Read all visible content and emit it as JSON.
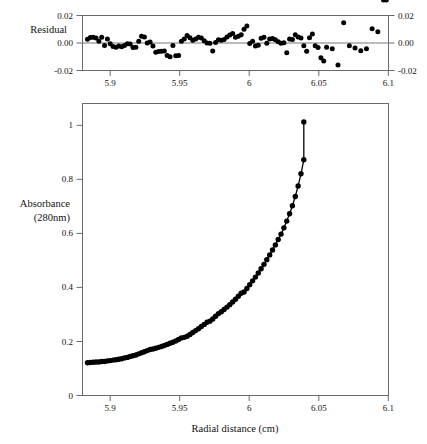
{
  "figure": {
    "background_color": "#ffffff",
    "point_color": "#000000",
    "axis_color": "#6a6a6a",
    "xaxis_title": "Radial distance (cm)",
    "residual_label": "Residual",
    "absorbance_label_line1": "Absorbance",
    "absorbance_label_line2": "(280nm)"
  },
  "chart_data": [
    {
      "type": "scatter",
      "title": "",
      "panel": "residual",
      "xlabel": "",
      "ylabel": "Residual",
      "xlim": [
        5.885,
        6.1
      ],
      "ylim": [
        -0.02,
        0.02
      ],
      "grid": false,
      "legend": "none",
      "xticks": [
        5.9,
        5.95,
        6,
        6.05,
        6.1
      ],
      "xtick_labels": [
        "5.9",
        "5.95",
        "6",
        "6.05",
        "6.1"
      ],
      "yticks": [
        -0.02,
        0.0,
        0.02
      ],
      "ytick_labels": [
        "-0.02",
        "0.00",
        "0.02"
      ],
      "right_axis_yticks": [
        -0.02,
        0.0,
        0.02
      ],
      "right_axis_ytick_labels": [
        "-0.02",
        "0.00",
        "0.02"
      ],
      "zero_reference_line": 0.0,
      "x": [
        5.8885,
        5.8905,
        5.8925,
        5.8945,
        5.8965,
        5.8985,
        5.9005,
        5.9025,
        5.9045,
        5.9065,
        5.9085,
        5.9105,
        5.9125,
        5.9145,
        5.9165,
        5.9185,
        5.9205,
        5.9225,
        5.9245,
        5.9265,
        5.9285,
        5.9305,
        5.9325,
        5.9345,
        5.9365,
        5.9385,
        5.9405,
        5.9425,
        5.9445,
        5.9465,
        5.9485,
        5.9505,
        5.9525,
        5.9545,
        5.9565,
        5.9585,
        5.9605,
        5.9625,
        5.9645,
        5.9665,
        5.9685,
        5.9705,
        5.9725,
        5.9745,
        5.9765,
        5.9785,
        5.9805,
        5.9825,
        5.9845,
        5.9865,
        5.9885,
        5.9905,
        5.9925,
        5.9945,
        5.9965,
        5.9985,
        6.0005,
        6.0025,
        6.0045,
        6.0065,
        6.0085,
        6.0105,
        6.0125,
        6.0145,
        6.0165,
        6.0185,
        6.0205,
        6.0225,
        6.0245,
        6.0265,
        6.0285,
        6.0305,
        6.0325,
        6.0345,
        6.0365,
        6.0385,
        6.0405,
        6.0425,
        6.0445,
        6.0465,
        6.0485,
        6.0505,
        6.0525,
        6.0545,
        6.0565,
        6.0605,
        6.0645,
        6.0685,
        6.0725,
        6.0765,
        6.0805,
        6.0845,
        6.0885,
        6.0925,
        6.0965,
        6.0985
      ],
      "y": [
        0.0028,
        0.004,
        0.0042,
        0.0036,
        0.0012,
        0.0042,
        -0.0018,
        0.003,
        -0.0006,
        -0.0026,
        -0.003,
        -0.0022,
        -0.0028,
        -0.0018,
        -0.0006,
        -0.0008,
        -0.0032,
        -0.003,
        0.0012,
        0.005,
        0.0044,
        0.0,
        0.0008,
        -0.0022,
        -0.0068,
        -0.0062,
        -0.006,
        -0.0058,
        -0.009,
        -0.01,
        -0.0018,
        -0.0092,
        -0.009,
        0.0012,
        0.003,
        0.0054,
        0.0038,
        0.002,
        0.003,
        0.0042,
        0.0036,
        0.0016,
        0.0,
        -0.0002,
        -0.0058,
        0.0004,
        0.0024,
        0.002,
        0.0026,
        0.0044,
        0.0058,
        0.007,
        0.0042,
        0.005,
        0.006,
        0.01,
        0.0124,
        -0.0004,
        0.0012,
        -0.0022,
        -0.0016,
        0.0034,
        0.0042,
        -0.0002,
        0.003,
        0.0032,
        0.0024,
        0.001,
        -0.0002,
        0.0002,
        -0.007,
        0.003,
        0.0026,
        0.006,
        0.0044,
        0.0036,
        -0.002,
        -0.006,
        0.0038,
        0.0066,
        -0.002,
        -0.0032,
        -0.0108,
        -0.013,
        -0.003,
        -0.0042,
        -0.016,
        0.0148,
        -0.002,
        -0.0036,
        -0.0056,
        -0.0042,
        0.0104,
        0.0082
      ]
    },
    {
      "type": "scatter",
      "panel": "main",
      "title": "",
      "xlabel": "Radial distance (cm)",
      "ylabel": "Absorbance (280nm)",
      "xlim": [
        5.885,
        6.1
      ],
      "ylim": [
        0,
        1.08
      ],
      "grid": false,
      "legend": "none",
      "xticks": [
        5.9,
        5.95,
        6,
        6.05,
        6.1
      ],
      "xtick_labels": [
        "5.9",
        "5.95",
        "6",
        "6.05",
        "6.1"
      ],
      "yticks": [
        0,
        0.2,
        0.4,
        0.6,
        0.8,
        1
      ],
      "ytick_labels": [
        "0",
        "0.2",
        "0.4",
        "0.6",
        "0.8",
        "1"
      ],
      "has_fit_curve": true,
      "fit_description": "single-exponential sedimentation equilibrium fit",
      "x": [
        5.8885,
        5.8905,
        5.8925,
        5.8945,
        5.8965,
        5.8985,
        5.9005,
        5.9025,
        5.9045,
        5.9065,
        5.9085,
        5.9105,
        5.9125,
        5.9145,
        5.9165,
        5.9185,
        5.9205,
        5.9225,
        5.9245,
        5.9265,
        5.9285,
        5.9305,
        5.9325,
        5.9345,
        5.9365,
        5.9385,
        5.9405,
        5.9425,
        5.9445,
        5.9465,
        5.9485,
        5.9505,
        5.9525,
        5.9545,
        5.9565,
        5.9585,
        5.9605,
        5.9625,
        5.9645,
        5.9665,
        5.9685,
        5.9705,
        5.9725,
        5.9745,
        5.9765,
        5.9785,
        5.9805,
        5.9825,
        5.9845,
        5.9865,
        5.9885,
        5.9905,
        5.9925,
        5.9945,
        5.9965,
        5.9985,
        6.0005,
        6.0025,
        6.0045,
        6.0065,
        6.0085,
        6.0105,
        6.0125,
        6.0145,
        6.0165,
        6.0185,
        6.0205,
        6.0225,
        6.0245,
        6.0265,
        6.0285,
        6.0305,
        6.0325,
        6.0345,
        6.0365,
        6.0385,
        6.0405
      ],
      "y": [
        0.121,
        0.122,
        0.123,
        0.124,
        0.124,
        0.126,
        0.126,
        0.128,
        0.129,
        0.131,
        0.132,
        0.134,
        0.136,
        0.139,
        0.141,
        0.144,
        0.147,
        0.15,
        0.154,
        0.158,
        0.162,
        0.166,
        0.17,
        0.172,
        0.175,
        0.178,
        0.181,
        0.185,
        0.189,
        0.193,
        0.197,
        0.202,
        0.207,
        0.213,
        0.215,
        0.219,
        0.226,
        0.233,
        0.24,
        0.247,
        0.255,
        0.263,
        0.271,
        0.275,
        0.283,
        0.293,
        0.303,
        0.31,
        0.318,
        0.327,
        0.336,
        0.346,
        0.356,
        0.367,
        0.378,
        0.383,
        0.396,
        0.41,
        0.424,
        0.438,
        0.453,
        0.469,
        0.485,
        0.502,
        0.52,
        0.538,
        0.557,
        0.577,
        0.597,
        0.62,
        0.645,
        0.672,
        0.702,
        0.736,
        0.775,
        0.82,
        0.872
      ],
      "curve_endpoint_high": {
        "x": 6.0405,
        "y": 1.012
      }
    }
  ]
}
